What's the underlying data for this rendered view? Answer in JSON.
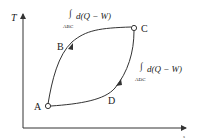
{
  "diagram": {
    "type": "T-s process diagram",
    "axes": {
      "y_label": "T",
      "x_label": "s"
    },
    "points": [
      {
        "id": "A",
        "label": "A"
      },
      {
        "id": "B",
        "label": "B"
      },
      {
        "id": "C",
        "label": "C"
      },
      {
        "id": "D",
        "label": "D"
      }
    ],
    "paths": [
      {
        "id": "ABC",
        "integral_symbol": "∫",
        "subscript": "ABC",
        "expression": "d(Q − W)"
      },
      {
        "id": "ADC",
        "integral_symbol": "∫",
        "subscript": "ADC",
        "expression": "d(Q − W)"
      }
    ],
    "colors": {
      "line": "#333333",
      "text": "#1a1a1a",
      "background": "#ffffff"
    }
  }
}
